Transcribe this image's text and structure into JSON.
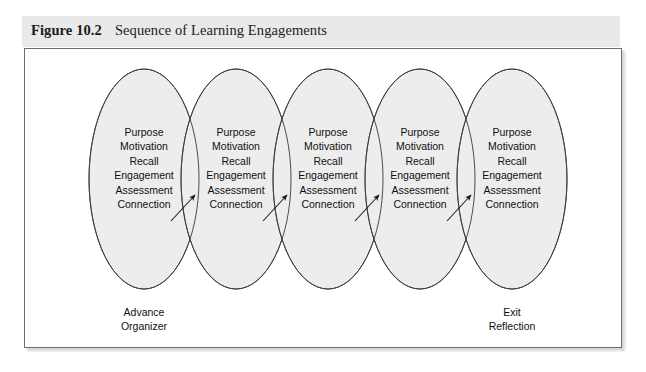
{
  "figure": {
    "label": "Figure 10.2",
    "title": "Sequence of Learning Engagements",
    "band_color": "#e9e9e9",
    "frame_border_color": "#6d6d6d",
    "ellipse_fill": "#ededed",
    "ellipse_stroke": "#3a3a3a",
    "text_color": "#101010"
  },
  "diagram": {
    "type": "overlapping-ellipse-sequence",
    "ellipse_count": 5,
    "items": [
      {
        "id": "engagement-1",
        "lines": [
          "Purpose",
          "Motivation",
          "Recall",
          "Engagement",
          "Assessment",
          "Connection"
        ]
      },
      {
        "id": "engagement-2",
        "lines": [
          "Purpose",
          "Motivation",
          "Recall",
          "Engagement",
          "Assessment",
          "Connection"
        ]
      },
      {
        "id": "engagement-3",
        "lines": [
          "Purpose",
          "Motivation",
          "Recall",
          "Engagement",
          "Assessment",
          "Connection"
        ]
      },
      {
        "id": "engagement-4",
        "lines": [
          "Purpose",
          "Motivation",
          "Recall",
          "Engagement",
          "Assessment",
          "Connection"
        ]
      },
      {
        "id": "engagement-5",
        "lines": [
          "Purpose",
          "Motivation",
          "Recall",
          "Engagement",
          "Assessment",
          "Connection"
        ]
      }
    ],
    "arrow_count": 4,
    "stage_labels": [
      {
        "id": "start",
        "lines": [
          "Advance",
          "Organizer"
        ]
      },
      {
        "id": "end",
        "lines": [
          "Exit",
          "Reflection"
        ]
      }
    ]
  }
}
